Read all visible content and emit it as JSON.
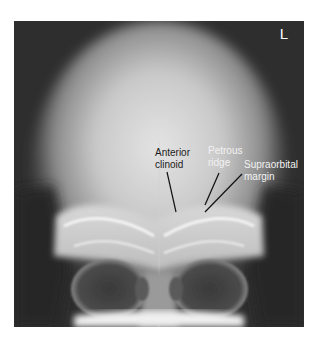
{
  "figure": {
    "side_marker": "L",
    "annotations": [
      {
        "id": "anterior-clinoid",
        "lines": [
          "Anterior",
          "clinoid"
        ],
        "text_color": "#1c1c1c"
      },
      {
        "id": "petrous-ridge",
        "lines": [
          "Petrous",
          "ridge"
        ],
        "text_color": "#f2f2f2"
      },
      {
        "id": "supraorbital-margin",
        "lines": [
          "Supraorbital",
          "margin"
        ],
        "text_color": "#f2f2f2"
      }
    ]
  },
  "colors": {
    "background": "#ffffff",
    "film_dark": "#2e2e2e",
    "bone_bright": "#f0f0f0",
    "leader_line": "#111111"
  }
}
